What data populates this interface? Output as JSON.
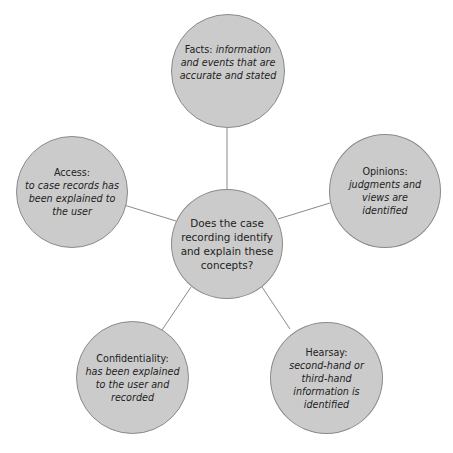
{
  "diagram": {
    "type": "hub-and-spoke",
    "colors": {
      "node_fill": "#cbcbcb",
      "node_border": "#8a8a8a",
      "line": "#8a8a8a",
      "background": "#ffffff"
    },
    "center": {
      "text": "Does the case recording identify and explain these concepts?"
    },
    "nodes": {
      "facts": {
        "title": "Facts: ",
        "desc": "information and events that are accurate and stated"
      },
      "access": {
        "title": "Access:",
        "desc": "to case records has been explained to the user"
      },
      "opinions": {
        "title": "Opinions:",
        "desc": "judgments and views are identified"
      },
      "confidentiality": {
        "title": "Confidentiality:",
        "desc": "has been explained to the user and recorded"
      },
      "hearsay": {
        "title": "Hearsay:",
        "desc": "second-hand or third-hand information is identified"
      }
    }
  }
}
